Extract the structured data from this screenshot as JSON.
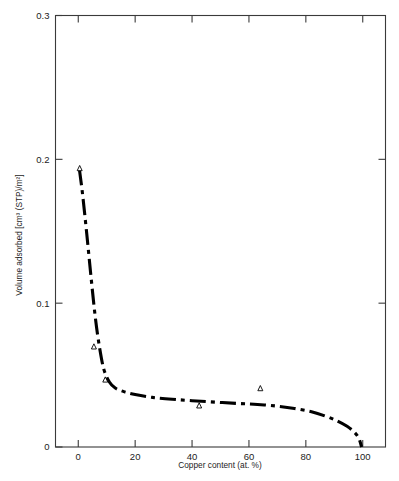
{
  "chart_data": {
    "type": "line",
    "title": "",
    "xlabel": "Copper content (at. %)",
    "ylabel": "Volume adsorbed [cm³ (STP)/m²]",
    "xlim": [
      -8,
      108
    ],
    "ylim": [
      0,
      0.3
    ],
    "xticks": [
      0,
      20,
      40,
      60,
      80,
      100
    ],
    "xtick_labels": [
      "0",
      "20",
      "40",
      "60",
      "80",
      "100"
    ],
    "yticks": [
      0,
      0.1,
      0.2,
      0.3
    ],
    "ytick_labels": [
      "0",
      "0.1",
      "0.2",
      "0.3"
    ],
    "grid": false,
    "legend": "none",
    "line_style": "dash-dot",
    "line_color": "#000000",
    "marker_style": "open-triangle",
    "series": [
      {
        "name": "Volume adsorbed",
        "curve_x": [
          0.4,
          1.5,
          3,
          4.5,
          6,
          7.5,
          9,
          11,
          13,
          16,
          20,
          26,
          33,
          40,
          48,
          56,
          63,
          70,
          76,
          82,
          87,
          91,
          94.5,
          97,
          98.6,
          99.6
        ],
        "curve_y": [
          0.193,
          0.176,
          0.148,
          0.118,
          0.09,
          0.069,
          0.054,
          0.045,
          0.041,
          0.0385,
          0.0365,
          0.0345,
          0.0332,
          0.0322,
          0.0312,
          0.0303,
          0.0296,
          0.0284,
          0.0268,
          0.0245,
          0.0214,
          0.0182,
          0.0144,
          0.0104,
          0.0062,
          0.0
        ],
        "points_x": [
          0.5,
          5.5,
          9.5,
          42.5,
          64
        ],
        "points_y": [
          0.1935,
          0.0695,
          0.0465,
          0.0285,
          0.0405
        ]
      }
    ]
  },
  "axes": {
    "top_ticks_visible": true,
    "right_ticks_visible": true
  }
}
